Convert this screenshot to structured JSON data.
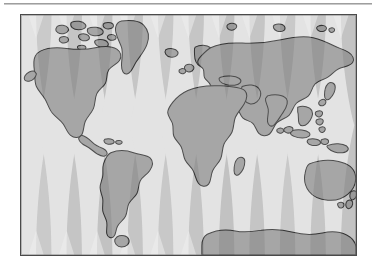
{
  "figure": {
    "kind": "world-map",
    "projection": "interrupted-gore overlay on rectangular world map",
    "background_color": "#ffffff",
    "frame": {
      "border_color": "#4a4a4a",
      "x": 20,
      "y": 14,
      "width": 337,
      "height": 242
    }
  },
  "rule": {
    "present": true,
    "color": "#9e9e9e",
    "label": ""
  },
  "palette": {
    "ocean": "#c7c7c7",
    "ocean_shade": "#bdbdbd",
    "land": "#9a9a9a",
    "land_shade": "#8f8f8f",
    "land_outline": "#303030",
    "gore_light": "#e3e3e3",
    "gore_lighter": "#eeeeee",
    "frame_border": "#4a4a4a"
  },
  "gores": {
    "count": 11,
    "description": "vertical lens/spindle gores, widest at the poles and pinched at the equator",
    "fill": "#e3e3e3",
    "equator_y_fraction": 0.46
  },
  "landmasses": [
    {
      "name": "North America"
    },
    {
      "name": "Greenland"
    },
    {
      "name": "Canadian Arctic Archipelago"
    },
    {
      "name": "Iceland"
    },
    {
      "name": "South America"
    },
    {
      "name": "Europe"
    },
    {
      "name": "British Isles"
    },
    {
      "name": "Scandinavia"
    },
    {
      "name": "Africa"
    },
    {
      "name": "Madagascar"
    },
    {
      "name": "Arabian Peninsula"
    },
    {
      "name": "Asia"
    },
    {
      "name": "India"
    },
    {
      "name": "Japan"
    },
    {
      "name": "Indonesia"
    },
    {
      "name": "Philippines"
    },
    {
      "name": "New Guinea"
    },
    {
      "name": "Australia"
    },
    {
      "name": "New Zealand"
    },
    {
      "name": "Antarctica"
    },
    {
      "name": "Svalbard"
    },
    {
      "name": "Novaya Zemlya"
    },
    {
      "name": "Sri Lanka"
    }
  ],
  "labels": {
    "title": "",
    "caption": ""
  }
}
